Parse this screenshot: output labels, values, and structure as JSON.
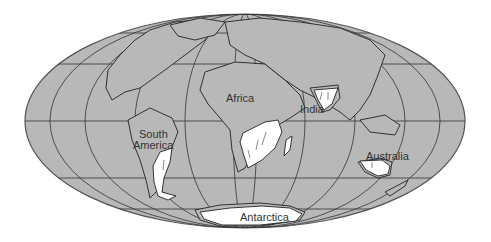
{
  "map": {
    "projection": "Mollweide (elliptical world map)",
    "colors": {
      "ocean_land": "#b8b8b8",
      "glaciated": "#ffffff",
      "grid": "#333333",
      "coast": "#222222",
      "background": "#ffffff"
    },
    "labels": {
      "africa": "Africa",
      "india": "India",
      "south_america_line1": "South",
      "south_america_line2": "America",
      "australia": "Australia",
      "antarctica": "Antarctica"
    }
  }
}
